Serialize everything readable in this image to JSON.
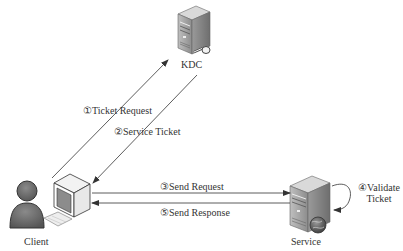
{
  "diagram": {
    "type": "kerberos-authentication-flow",
    "nodes": {
      "kdc": {
        "label": "KDC",
        "icon": "server-key-icon"
      },
      "client": {
        "label": "Client",
        "icon": "user-computer-icon"
      },
      "service": {
        "label": "Service",
        "icon": "server-globe-icon"
      }
    },
    "edges": [
      {
        "id": "e1",
        "from": "client",
        "to": "kdc",
        "label": "①Ticket Request"
      },
      {
        "id": "e2",
        "from": "kdc",
        "to": "client",
        "label": "②Service Ticket"
      },
      {
        "id": "e3",
        "from": "client",
        "to": "service",
        "label": "③Send Request"
      },
      {
        "id": "e4",
        "from": "service",
        "to": "service",
        "label_line1": "④Validate",
        "label_line2": "Ticket"
      },
      {
        "id": "e5",
        "from": "service",
        "to": "client",
        "label": "⑤Send Response"
      }
    ],
    "colors": {
      "line": "#333333",
      "server_light": "#d9d9d9",
      "server_mid": "#a6a6a6",
      "server_dark": "#7f7f7f",
      "person": "#6b6b6b"
    }
  }
}
